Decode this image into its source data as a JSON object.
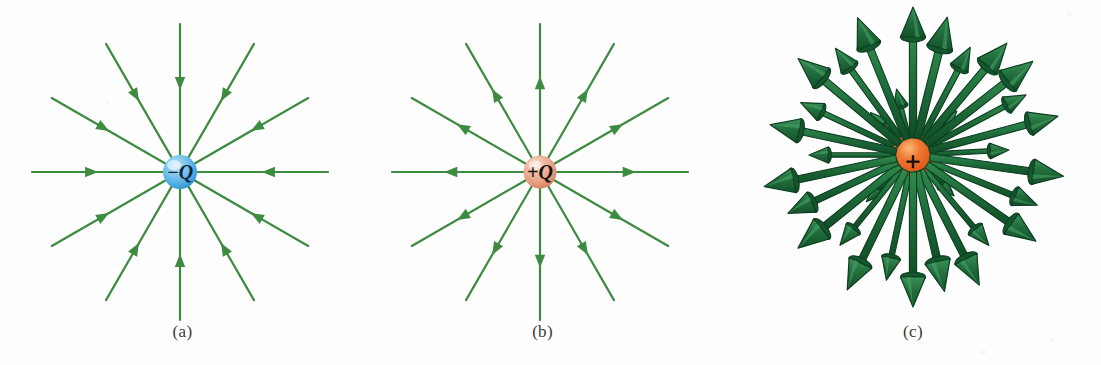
{
  "figure": {
    "background_color": "#ffffff",
    "field_line_color": "#3d8b40",
    "field_line_color_3d": "#1e6b38",
    "field_line_outline_3d": "#0d3d20",
    "negative_sphere_color": "#5ab4e8",
    "negative_sphere_highlight": "#b9e2f7",
    "positive_sphere_color": "#e8a088",
    "positive_sphere_highlight": "#f7ded2",
    "positive_sphere_3d_color": "#e8622a",
    "positive_sphere_3d_highlight": "#f59a5c",
    "caption_color": "#3a3a3a"
  },
  "panels": [
    {
      "id": "a",
      "caption": "(a)",
      "charge_label": "−Q",
      "charge_sign": "negative",
      "sphere_color": "#5ab4e8",
      "field_direction": "inward",
      "line_count": 12,
      "angle_step_deg": 30,
      "center_x": 180,
      "center_y": 172,
      "sphere_radius": 17,
      "line_length": 148,
      "arrow_position_fraction": 0.55
    },
    {
      "id": "b",
      "caption": "(b)",
      "charge_label": "+Q",
      "charge_sign": "positive",
      "sphere_color": "#e8a088",
      "field_direction": "outward",
      "line_count": 12,
      "angle_step_deg": 30,
      "center_x": 180,
      "center_y": 172,
      "sphere_radius": 16,
      "line_length": 148,
      "arrow_position_fraction": 0.55
    },
    {
      "id": "c",
      "caption": "(c)",
      "charge_label": "+",
      "charge_sign": "positive",
      "sphere_color": "#e8622a",
      "field_direction": "outward",
      "render_style": "3d-perspective",
      "arrow_count": 26,
      "center_x": 188,
      "center_y": 155,
      "sphere_radius": 21,
      "note": "three-dimensional cone-tipped vectors radiating in all directions"
    }
  ],
  "chart_data": {
    "type": "diagram",
    "subplots": [
      {
        "label": "(a)",
        "description": "Field lines of an isolated negative point charge −Q; 12 straight lines converge radially on the charge with arrowheads pointing inward.",
        "charge": "−Q",
        "polarity": "negative",
        "line_count": 12,
        "angles_deg": [
          0,
          30,
          60,
          90,
          120,
          150,
          180,
          210,
          240,
          270,
          300,
          330
        ],
        "arrow_direction": "toward-charge"
      },
      {
        "label": "(b)",
        "description": "Field lines of an isolated positive point charge +Q; 12 straight lines diverge radially from the charge with arrowheads pointing outward.",
        "charge": "+Q",
        "polarity": "positive",
        "line_count": 12,
        "angles_deg": [
          0,
          30,
          60,
          90,
          120,
          150,
          180,
          210,
          240,
          270,
          300,
          330
        ],
        "arrow_direction": "away-from-charge"
      },
      {
        "label": "(c)",
        "description": "Three-dimensional representation of the field of a positive point charge; cone-tipped vectors radiate outward in all directions from the charge.",
        "charge": "+",
        "polarity": "positive",
        "arrow_count": 26,
        "arrow_direction": "away-from-charge",
        "render": "3d"
      }
    ]
  },
  "vectors_3d": [
    {
      "angle": 90,
      "len": 148,
      "scale": 1.0,
      "depth": 0
    },
    {
      "angle": 76,
      "len": 142,
      "scale": 1.05,
      "depth": 0
    },
    {
      "angle": 62,
      "len": 122,
      "scale": 0.78,
      "depth": 1
    },
    {
      "angle": 50,
      "len": 146,
      "scale": 1.0,
      "depth": 0
    },
    {
      "angle": 38,
      "len": 152,
      "scale": 1.05,
      "depth": 0
    },
    {
      "angle": 28,
      "len": 128,
      "scale": 0.72,
      "depth": 1
    },
    {
      "angle": 15,
      "len": 150,
      "scale": 0.96,
      "depth": 0
    },
    {
      "angle": 3,
      "len": 96,
      "scale": 0.62,
      "depth": 2
    },
    {
      "angle": 352,
      "len": 152,
      "scale": 1.02,
      "depth": 0
    },
    {
      "angle": 338,
      "len": 134,
      "scale": 0.8,
      "depth": 1
    },
    {
      "angle": 325,
      "len": 150,
      "scale": 1.0,
      "depth": 0
    },
    {
      "angle": 310,
      "len": 118,
      "scale": 0.7,
      "depth": 1
    },
    {
      "angle": 297,
      "len": 146,
      "scale": 0.98,
      "depth": 0
    },
    {
      "angle": 283,
      "len": 140,
      "scale": 1.02,
      "depth": 0
    },
    {
      "angle": 270,
      "len": 152,
      "scale": 1.0,
      "depth": 0
    },
    {
      "angle": 258,
      "len": 128,
      "scale": 0.76,
      "depth": 1
    },
    {
      "angle": 244,
      "len": 150,
      "scale": 1.0,
      "depth": 0
    },
    {
      "angle": 231,
      "len": 116,
      "scale": 0.7,
      "depth": 1
    },
    {
      "angle": 219,
      "len": 148,
      "scale": 1.02,
      "depth": 0
    },
    {
      "angle": 205,
      "len": 138,
      "scale": 0.88,
      "depth": 0
    },
    {
      "angle": 192,
      "len": 152,
      "scale": 1.0,
      "depth": 0
    },
    {
      "angle": 180,
      "len": 104,
      "scale": 0.64,
      "depth": 2
    },
    {
      "angle": 168,
      "len": 146,
      "scale": 0.98,
      "depth": 0
    },
    {
      "angle": 155,
      "len": 124,
      "scale": 0.74,
      "depth": 1
    },
    {
      "angle": 140,
      "len": 150,
      "scale": 1.02,
      "depth": 0
    },
    {
      "angle": 126,
      "len": 132,
      "scale": 0.8,
      "depth": 1
    },
    {
      "angle": 112,
      "len": 148,
      "scale": 1.0,
      "depth": 0
    },
    {
      "angle": 104,
      "len": 68,
      "scale": 0.58,
      "depth": 2
    },
    {
      "angle": 45,
      "len": 62,
      "scale": 0.56,
      "depth": 2
    },
    {
      "angle": 315,
      "len": 58,
      "scale": 0.54,
      "depth": 2
    },
    {
      "angle": 225,
      "len": 66,
      "scale": 0.58,
      "depth": 2
    },
    {
      "angle": 135,
      "len": 60,
      "scale": 0.55,
      "depth": 2
    }
  ]
}
